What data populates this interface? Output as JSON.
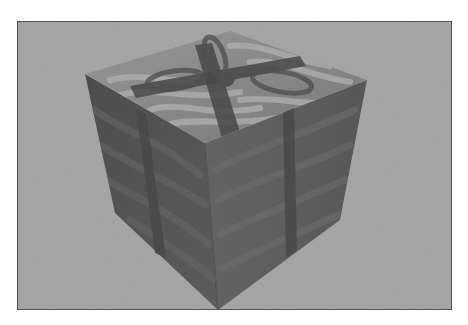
{
  "figure": {
    "canvas": {
      "width": 468,
      "height": 325,
      "page_background": "#ffffff"
    },
    "frame": {
      "x": 17,
      "y": 21,
      "width": 435,
      "height": 289,
      "border_color": "#3a3a3a",
      "border_width": 1.5,
      "fill": "#a9a9a9"
    },
    "cube": {
      "vertices": {
        "top_back": [
          230,
          31
        ],
        "top_left": [
          85,
          74
        ],
        "top_right": [
          367,
          80
        ],
        "top_front": [
          205,
          143
        ],
        "left_bottom": [
          115,
          213
        ],
        "right_bottom": [
          340,
          220
        ],
        "bottom": [
          218,
          310
        ]
      },
      "colors": {
        "top_face": "#8a8a8a",
        "top_face_highlight": "#b4b4b4",
        "left_face": "#575757",
        "right_face": "#616161",
        "edge_shadow": "#444444",
        "ribbon": "#4a4a4a",
        "bow": "#525252"
      }
    },
    "ribbon": {
      "left_face_band": [
        [
          136,
          109
        ],
        [
          146,
          114
        ],
        [
          166,
          258
        ],
        [
          155,
          253
        ]
      ],
      "right_face_band": [
        [
          283,
          113
        ],
        [
          294,
          108
        ],
        [
          297,
          250
        ],
        [
          286,
          258
        ]
      ],
      "top_band_a": [
        [
          195,
          45
        ],
        [
          212,
          43
        ],
        [
          240,
          132
        ],
        [
          222,
          138
        ]
      ],
      "top_band_b": [
        [
          130,
          86
        ],
        [
          300,
          56
        ],
        [
          306,
          66
        ],
        [
          136,
          98
        ]
      ]
    },
    "bow": {
      "center": [
        226,
        78
      ],
      "loops": [
        {
          "cx": 175,
          "cy": 80,
          "rx": 28,
          "ry": 9,
          "rotate": -8
        },
        {
          "cx": 282,
          "cy": 82,
          "rx": 30,
          "ry": 10,
          "rotate": 10
        },
        {
          "cx": 215,
          "cy": 56,
          "rx": 9,
          "ry": 20,
          "rotate": -20
        }
      ]
    },
    "wrap_stripes": {
      "top": [
        {
          "d": "M110 80 C150 70, 180 90, 220 75"
        },
        {
          "d": "M120 95 C160 85, 190 102, 240 92"
        },
        {
          "d": "M150 110 C180 100, 210 118, 260 108"
        },
        {
          "d": "M170 124 C200 116, 240 130, 300 112"
        },
        {
          "d": "M230 46 C260 42, 290 60, 330 66"
        },
        {
          "d": "M250 62 C280 58, 310 76, 350 82"
        },
        {
          "d": "M240 100 C280 95, 310 110, 340 98"
        }
      ],
      "left": [
        {
          "d": "M95 110 C120 130, 160 140, 200 175"
        },
        {
          "d": "M100 145 C130 165, 170 180, 205 205"
        },
        {
          "d": "M108 180 C140 200, 175 215, 210 245"
        },
        {
          "d": "M130 220 C160 240, 185 255, 215 280"
        }
      ],
      "right": [
        {
          "d": "M215 170 C250 150, 290 140, 355 110"
        },
        {
          "d": "M218 200 C255 180, 300 170, 350 145"
        },
        {
          "d": "M220 235 C260 215, 300 200, 345 180"
        },
        {
          "d": "M222 268 C260 250, 295 235, 338 215"
        }
      ]
    }
  }
}
